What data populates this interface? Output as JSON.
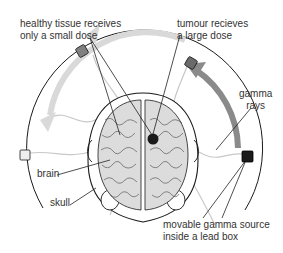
{
  "diagram": {
    "labels": {
      "healthy_tissue": [
        "healthy tissue receives",
        "only a small dose"
      ],
      "tumour": [
        "tumour recieves",
        "a large dose"
      ],
      "gamma_rays": [
        "gamma",
        "rays"
      ],
      "brain": "brain",
      "skull": "skull",
      "source": [
        "movable gamma source",
        "inside a lead box"
      ]
    },
    "colors": {
      "line": "#222222",
      "ring": "#1a1a1a",
      "arrow_light": "#d9d9d9",
      "arrow_dark": "#8a8a8a",
      "brain_fill": "#dcdcdc",
      "source_dark": "#1a1a1a",
      "source_mid": "#808080",
      "source_light": "#eeeeee",
      "ray": "#b8b8b8"
    }
  }
}
